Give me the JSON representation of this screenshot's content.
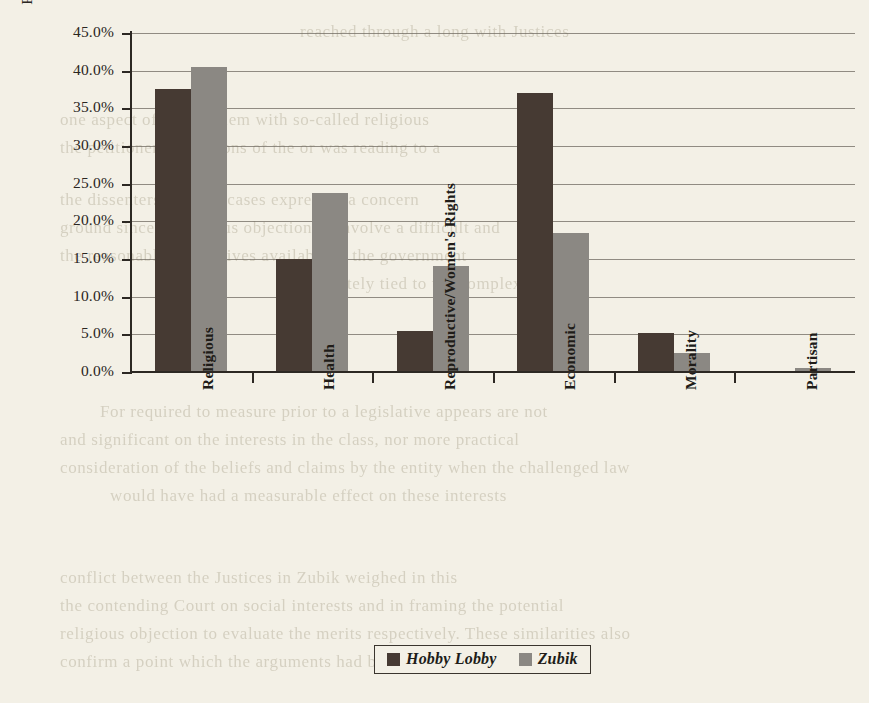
{
  "chart_data": {
    "type": "bar",
    "title": "",
    "xlabel": "",
    "ylabel": "Percent of Total Framing Statements",
    "ylim": [
      0,
      45
    ],
    "ytick_step": 5,
    "grid": true,
    "legend_position": "bottom-center",
    "categories": [
      "Religious",
      "Health",
      "Reproductive/Women's Rights",
      "Economic",
      "Morality",
      "Partisan"
    ],
    "ytick_labels": [
      "0.0%",
      "5.0%",
      "10.0%",
      "15.0%",
      "20.0%",
      "25.0%",
      "30.0%",
      "35.0%",
      "40.0%",
      "45.0%"
    ],
    "series": [
      {
        "name": "Hobby Lobby",
        "color": "#463a33",
        "values": [
          37.5,
          15.0,
          5.5,
          37.0,
          5.2,
          0.0
        ]
      },
      {
        "name": "Zubik",
        "color": "#8b8883",
        "values": [
          40.5,
          23.8,
          14.1,
          18.5,
          2.5,
          0.5
        ]
      }
    ]
  },
  "legend": {
    "entries": [
      {
        "label": "Hobby Lobby",
        "swatch": "hl"
      },
      {
        "label": "Zubik",
        "swatch": "zb"
      }
    ]
  },
  "page_background": {
    "paper_color": "#f3f0e6",
    "bleed_through_lines": [
      {
        "text": "reached through a long with Justices",
        "x": 300,
        "y": 22
      },
      {
        "text": "one aspect of the problem with so-called religious",
        "x": 60,
        "y": 110
      },
      {
        "text": "the petitioner's assertions of the or was reading to a",
        "x": 60,
        "y": 138
      },
      {
        "text": "the dissenters in these cases expressed a concern",
        "x": 60,
        "y": 190
      },
      {
        "text": "ground sincere religious objection to involve a difficult and",
        "x": 60,
        "y": 218
      },
      {
        "text": "the reasonable alternatives available to the government",
        "x": 60,
        "y": 246
      },
      {
        "text": "intimately tied to the complex",
        "x": 300,
        "y": 274
      },
      {
        "text": "For required to measure prior to a legislative appears are not",
        "x": 100,
        "y": 402
      },
      {
        "text": "and significant on the interests in the class, nor more practical",
        "x": 60,
        "y": 430
      },
      {
        "text": "consideration of the beliefs and claims by the entity when the challenged law",
        "x": 60,
        "y": 458
      },
      {
        "text": "would have had a measurable effect on these interests",
        "x": 110,
        "y": 486
      },
      {
        "text": "conflict between the Justices in Zubik weighed in this",
        "x": 60,
        "y": 568
      },
      {
        "text": "the contending Court on social interests and in framing the potential",
        "x": 60,
        "y": 596
      },
      {
        "text": "religious objection to evaluate the merits respectively. These similarities also",
        "x": 60,
        "y": 624
      },
      {
        "text": "confirm a point which the arguments had been that the",
        "x": 60,
        "y": 652
      }
    ]
  }
}
